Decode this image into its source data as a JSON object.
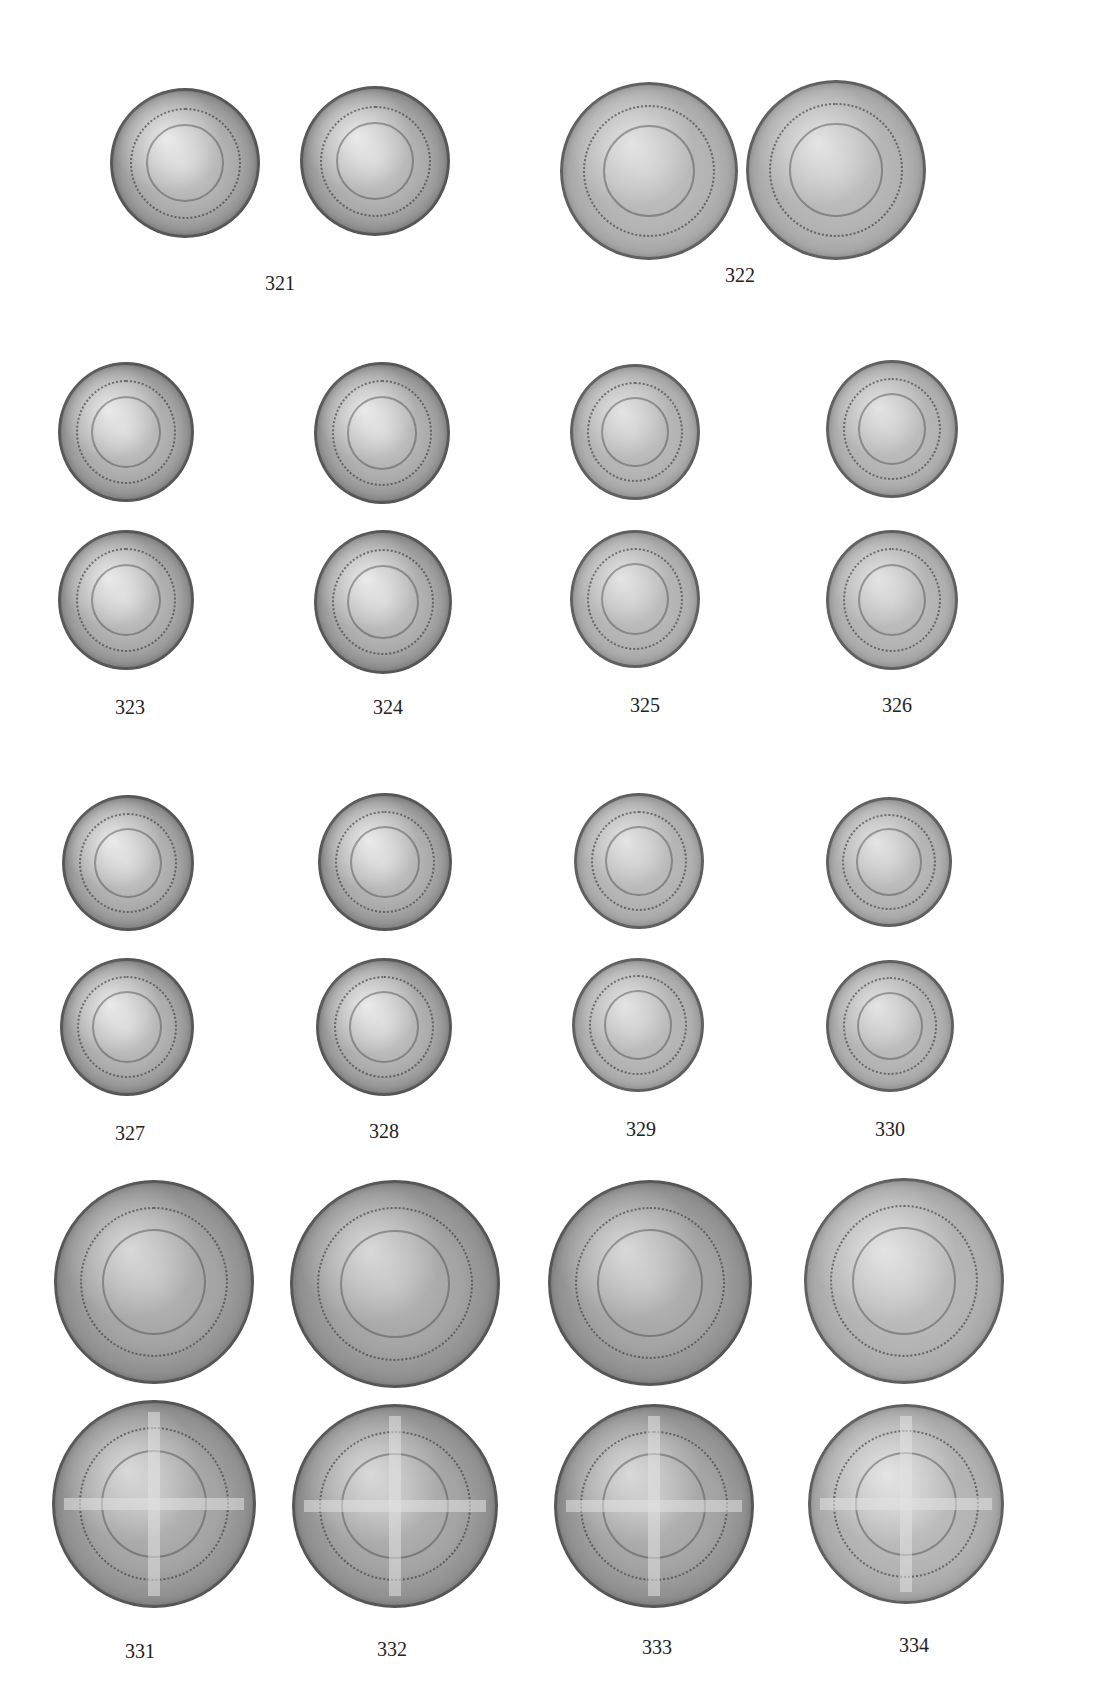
{
  "plate": {
    "background": "#ffffff",
    "label_color": "#222222",
    "rows": [
      {
        "entries": [
          {
            "number": "321",
            "sides": [
              "obverse: king in ship",
              "reverse: cross and lions in rose"
            ]
          },
          {
            "number": "322",
            "sides": [
              "obverse: king in ship",
              "reverse: cross and lions in rose"
            ]
          }
        ]
      },
      {
        "entries": [
          {
            "number": "323",
            "sides": [
              "obverse: shield in tressure",
              "reverse: rose pattern"
            ]
          },
          {
            "number": "324",
            "sides": [
              "obverse: shield in tressure",
              "reverse: rose pattern"
            ]
          },
          {
            "number": "325",
            "sides": [
              "obverse: shield in tressure",
              "reverse: rose pattern"
            ]
          },
          {
            "number": "326",
            "sides": [
              "obverse: shield in tressure",
              "reverse: rose pattern"
            ]
          }
        ]
      },
      {
        "entries": [
          {
            "number": "327",
            "sides": [
              "obverse: shield in tressure",
              "reverse: rose pattern"
            ]
          },
          {
            "number": "328",
            "sides": [
              "obverse: shield in tressure",
              "reverse: rose pattern"
            ]
          },
          {
            "number": "329",
            "sides": [
              "obverse: shield in tressure",
              "reverse: rose pattern"
            ]
          },
          {
            "number": "330",
            "sides": [
              "obverse: shield in tressure",
              "reverse: rose pattern"
            ]
          }
        ]
      },
      {
        "entries": [
          {
            "number": "331",
            "sides": [
              "obverse: crowned facing bust",
              "reverse: long cross and pellets"
            ]
          },
          {
            "number": "332",
            "sides": [
              "obverse: crowned facing bust",
              "reverse: long cross and pellets"
            ]
          },
          {
            "number": "333",
            "sides": [
              "obverse: crowned facing bust",
              "reverse: long cross and pellets"
            ]
          },
          {
            "number": "334",
            "sides": [
              "obverse: crowned facing bust",
              "reverse: long cross and pellets"
            ]
          }
        ]
      }
    ]
  }
}
